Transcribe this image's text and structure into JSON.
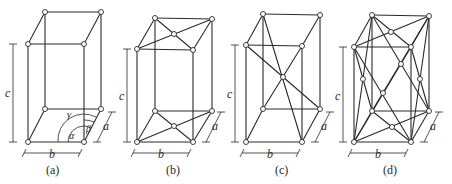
{
  "figure": {
    "panels": [
      {
        "id": "a",
        "caption": "(a)",
        "type": "simple",
        "dims": {
          "a": "a",
          "b": "b",
          "c": "c"
        },
        "angles": {
          "alpha": "α",
          "beta": "β",
          "gamma": "γ"
        }
      },
      {
        "id": "b",
        "caption": "(b)",
        "type": "base-centered",
        "dims": {
          "a": "a",
          "b": "b",
          "c": "c"
        }
      },
      {
        "id": "c",
        "caption": "(c)",
        "type": "body-centered",
        "dims": {
          "a": "a",
          "b": "b",
          "c": "c"
        }
      },
      {
        "id": "d",
        "caption": "(d)",
        "type": "face-centered",
        "dims": {
          "a": "a",
          "b": "b",
          "c": "c"
        }
      }
    ]
  }
}
